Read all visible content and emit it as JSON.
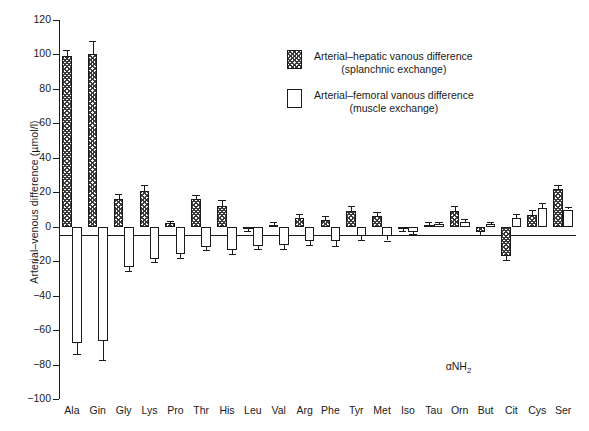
{
  "chart_data": {
    "type": "bar",
    "title": "",
    "xlabel": "",
    "ylabel": "Arterial–venous difference (µmol/l)",
    "ylim": [
      -100,
      120
    ],
    "yticks": [
      -100,
      -80,
      -60,
      -40,
      -20,
      0,
      20,
      40,
      60,
      80,
      100,
      120
    ],
    "grid": false,
    "legend_position": "upper-center",
    "categories": [
      "Ala",
      "Gin",
      "Gly",
      "Lys",
      "Pro",
      "Thr",
      "His",
      "Leu",
      "Val",
      "Arg",
      "Phe",
      "Tyr",
      "Met",
      "Iso",
      "Tau",
      "Orn",
      "But",
      "Cit",
      "Cys",
      "Ser"
    ],
    "series": [
      {
        "name": "Arterial–hepatic vanous difference (splanchnic exchange)",
        "style": "hatched",
        "values": [
          99,
          100,
          16,
          21,
          2,
          16,
          12,
          -1,
          1,
          5,
          4,
          9,
          6,
          -1,
          1,
          9,
          -3,
          -17,
          7,
          22
        ],
        "errors": [
          3.5,
          8,
          3,
          3.5,
          1.5,
          2.5,
          3.5,
          1.5,
          1.5,
          2.5,
          2.5,
          3,
          2.5,
          1.5,
          1.5,
          3,
          2,
          2.5,
          2.5,
          2
        ]
      },
      {
        "name": "Arterial–femoral vanous difference (muscle exchange)",
        "style": "open",
        "values": [
          -67.5,
          -66.5,
          -23.5,
          -18.5,
          -16,
          -11.5,
          -13.5,
          -11,
          -10.5,
          -8.5,
          -8.5,
          -5.5,
          -5.5,
          -3,
          1.5,
          2.5,
          1.5,
          5,
          11,
          10
        ],
        "errors": [
          6.5,
          11,
          2,
          2,
          2,
          2,
          2.5,
          2,
          2.5,
          2,
          2.5,
          2,
          2.5,
          1.5,
          1.5,
          2,
          1.5,
          2.5,
          2.5,
          1.5
        ]
      }
    ],
    "annotations": [
      {
        "text": "αNH2",
        "near": "Orn",
        "note": "alpha-amino nitrogen marker"
      }
    ]
  },
  "axes": {
    "y_title": "Arterial–venous difference (µmol/l)",
    "y_tick_labels": [
      "120",
      "100",
      "80",
      "60",
      "40",
      "20",
      "0",
      "−20",
      "−40",
      "−60",
      "−80",
      "−100"
    ]
  },
  "legend": {
    "entries": [
      {
        "swatch": "hatched-swatch",
        "line1": "Arterial–hepatic vanous difference",
        "line2": "(splanchnic exchange)"
      },
      {
        "swatch": "open-swatch",
        "line1": "Arterial–femoral vanous difference",
        "line2": "(muscle exchange)"
      }
    ]
  },
  "annotation": {
    "alpha_amino": "αNH",
    "alpha_amino_sub": "2"
  }
}
